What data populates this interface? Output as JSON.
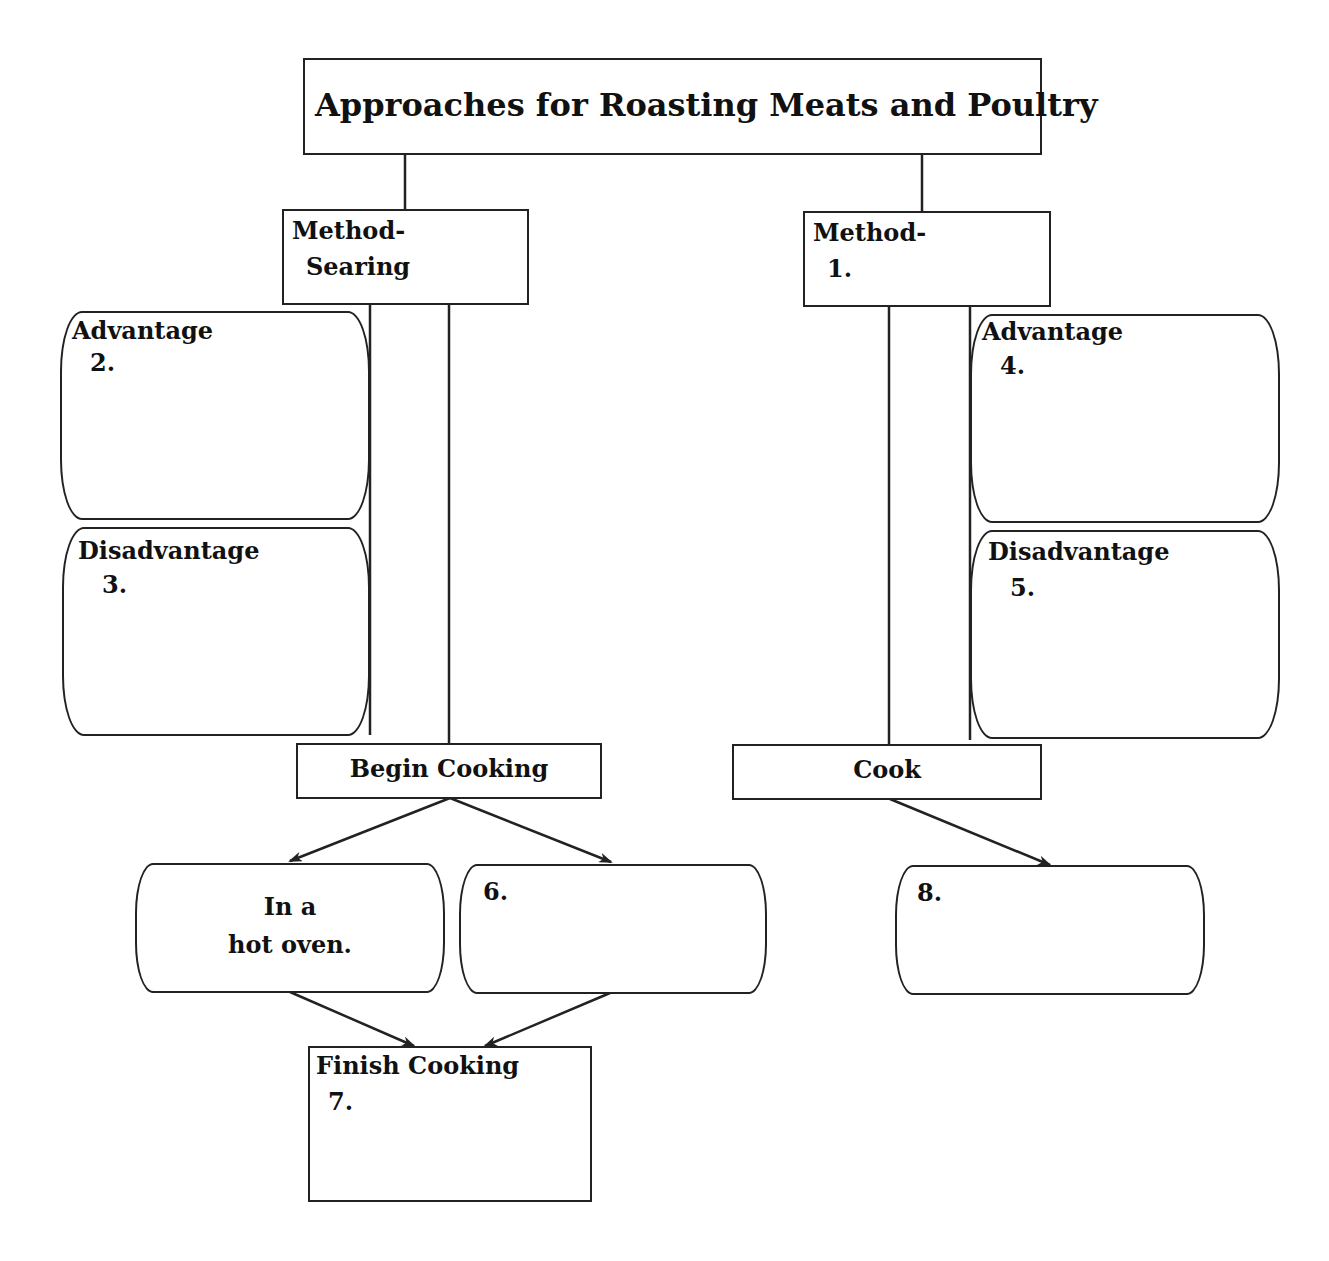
{
  "diagram": {
    "title": "Approaches for Roasting Meats and Poultry",
    "left_method": {
      "line1": "Method-",
      "line2": "Searing"
    },
    "right_method": {
      "line1": "Method-",
      "line2": "1."
    },
    "left_advantage": {
      "heading": "Advantage",
      "number": "2."
    },
    "left_disadvantage": {
      "heading": "Disadvantage",
      "number": "3."
    },
    "right_advantage": {
      "heading": "Advantage",
      "number": "4."
    },
    "right_disadvantage": {
      "heading": "Disadvantage",
      "number": "5."
    },
    "begin_cooking": "Begin Cooking",
    "cook": "Cook",
    "hot_oven": {
      "line1": "In a",
      "line2": "hot oven."
    },
    "option_6": "6.",
    "finish_cooking": {
      "heading": "Finish Cooking",
      "number": "7."
    },
    "option_8": "8."
  },
  "colors": {
    "stroke": "#222222",
    "background": "#ffffff",
    "text": "#111111"
  }
}
